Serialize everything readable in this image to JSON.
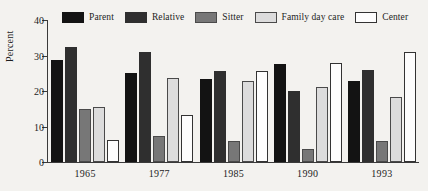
{
  "chart_data": {
    "type": "bar",
    "title": "",
    "subtitle": "",
    "xlabel": "",
    "ylabel": "Percent",
    "categories": [
      "1965",
      "1977",
      "1985",
      "1990",
      "1993"
    ],
    "ylim": [
      0,
      40
    ],
    "yticks": [
      0,
      10,
      20,
      30,
      40
    ],
    "ytick_labels": [
      "0",
      "10",
      "20",
      "30",
      "40"
    ],
    "grid": false,
    "legend_position": "top",
    "orientation": "vertical",
    "grouped": true,
    "series": [
      {
        "name": "Parent",
        "color": "#131313",
        "border": "#131313",
        "values": [
          28.7,
          25.2,
          23.4,
          27.5,
          22.7
        ]
      },
      {
        "name": "Relative",
        "color": "#2f2f2f",
        "border": "#2f2f2f",
        "values": [
          32.4,
          31.1,
          25.7,
          20.1,
          25.9
        ]
      },
      {
        "name": "Sitter",
        "color": "#777777",
        "border": "#4a4a4a",
        "values": [
          15.0,
          7.4,
          5.8,
          3.7,
          6.0
        ]
      },
      {
        "name": "Family day care",
        "color": "#dcdcdc",
        "border": "#4a4a4a",
        "values": [
          15.4,
          23.7,
          22.7,
          21.0,
          18.3
        ]
      },
      {
        "name": "Center",
        "color": "#fdfdfd",
        "border": "#333333",
        "values": [
          6.3,
          13.2,
          25.6,
          27.9,
          31.1
        ]
      }
    ]
  },
  "legend": {
    "entries": [
      {
        "label": "Parent"
      },
      {
        "label": "Relative"
      },
      {
        "label": "Sitter"
      },
      {
        "label": "Family day care"
      },
      {
        "label": "Center"
      }
    ]
  },
  "colors": {
    "background": "#f3f2ef",
    "axis": "#3a3a3a",
    "text": "#1d1d1d"
  }
}
